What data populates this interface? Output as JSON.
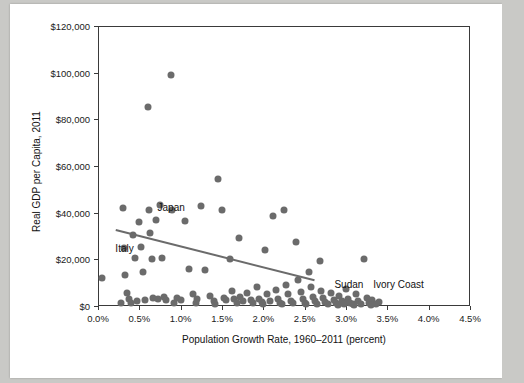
{
  "chart_data": {
    "type": "scatter",
    "title": "",
    "xlabel": "Population Growth Rate, 1960–2011 (percent)",
    "ylabel": "Real GDP per Capita, 2011",
    "xlim": [
      0.0,
      4.5
    ],
    "ylim": [
      0,
      120000
    ],
    "grid": false,
    "legend": "none",
    "xticks": [
      "0.0%",
      "0.5%",
      "1.0%",
      "1.5%",
      "2.0%",
      "2.5%",
      "3.0%",
      "3.5%",
      "4.0%",
      "4.5%"
    ],
    "xtick_values": [
      0.0,
      0.5,
      1.0,
      1.5,
      2.0,
      2.5,
      3.0,
      3.5,
      4.0,
      4.5
    ],
    "yticks": [
      "$0",
      "$20,000",
      "$40,000",
      "$60,000",
      "$80,000",
      "$100,000",
      "$120,000"
    ],
    "ytick_values": [
      0,
      20000,
      40000,
      60000,
      80000,
      100000,
      120000
    ],
    "annotations": [
      {
        "label": "Japan",
        "x": 0.72,
        "y": 41500
      },
      {
        "label": "Italy",
        "x": 0.21,
        "y": 24000
      },
      {
        "label": "Sudan",
        "x": 2.86,
        "y": 8500
      },
      {
        "label": "Ivory Coast",
        "x": 3.33,
        "y": 8500
      }
    ],
    "trendline": {
      "x0": 0.22,
      "y0": 33000,
      "x1": 2.62,
      "y1": 11500
    },
    "points": [
      {
        "x": 0.05,
        "y": 12000
      },
      {
        "x": 0.3,
        "y": 42000
      },
      {
        "x": 0.32,
        "y": 25000
      },
      {
        "x": 0.33,
        "y": 13500
      },
      {
        "x": 0.35,
        "y": 5500
      },
      {
        "x": 0.38,
        "y": 3000
      },
      {
        "x": 0.42,
        "y": 30500
      },
      {
        "x": 0.45,
        "y": 20500
      },
      {
        "x": 0.47,
        "y": 2000
      },
      {
        "x": 0.5,
        "y": 36000
      },
      {
        "x": 0.52,
        "y": 25500
      },
      {
        "x": 0.55,
        "y": 14500
      },
      {
        "x": 0.57,
        "y": 2500
      },
      {
        "x": 0.6,
        "y": 85500
      },
      {
        "x": 0.62,
        "y": 41000
      },
      {
        "x": 0.63,
        "y": 31500
      },
      {
        "x": 0.65,
        "y": 20000
      },
      {
        "x": 0.66,
        "y": 3500
      },
      {
        "x": 0.7,
        "y": 37000
      },
      {
        "x": 0.72,
        "y": 3000
      },
      {
        "x": 0.75,
        "y": 43500
      },
      {
        "x": 0.78,
        "y": 20500
      },
      {
        "x": 0.8,
        "y": 4000
      },
      {
        "x": 0.82,
        "y": 2500
      },
      {
        "x": 0.88,
        "y": 99000
      },
      {
        "x": 0.9,
        "y": 41000
      },
      {
        "x": 0.95,
        "y": 3500
      },
      {
        "x": 1.0,
        "y": 2500
      },
      {
        "x": 1.05,
        "y": 36500
      },
      {
        "x": 1.1,
        "y": 16000
      },
      {
        "x": 1.15,
        "y": 5000
      },
      {
        "x": 1.2,
        "y": 3000
      },
      {
        "x": 1.25,
        "y": 43000
      },
      {
        "x": 1.3,
        "y": 15500
      },
      {
        "x": 1.35,
        "y": 4500
      },
      {
        "x": 1.4,
        "y": 2000
      },
      {
        "x": 1.45,
        "y": 54500
      },
      {
        "x": 1.5,
        "y": 41000
      },
      {
        "x": 1.52,
        "y": 3500
      },
      {
        "x": 1.55,
        "y": 2500
      },
      {
        "x": 1.6,
        "y": 20000
      },
      {
        "x": 1.62,
        "y": 6500
      },
      {
        "x": 1.65,
        "y": 3000
      },
      {
        "x": 1.7,
        "y": 29000
      },
      {
        "x": 1.72,
        "y": 4000
      },
      {
        "x": 1.75,
        "y": 2000
      },
      {
        "x": 1.8,
        "y": 5500
      },
      {
        "x": 1.85,
        "y": 2500
      },
      {
        "x": 1.88,
        "y": 1500
      },
      {
        "x": 1.92,
        "y": 8000
      },
      {
        "x": 1.95,
        "y": 3000
      },
      {
        "x": 1.98,
        "y": 1800
      },
      {
        "x": 2.02,
        "y": 24000
      },
      {
        "x": 2.05,
        "y": 5000
      },
      {
        "x": 2.08,
        "y": 2000
      },
      {
        "x": 2.12,
        "y": 38500
      },
      {
        "x": 2.15,
        "y": 7000
      },
      {
        "x": 2.18,
        "y": 3000
      },
      {
        "x": 2.2,
        "y": 1500
      },
      {
        "x": 2.25,
        "y": 41000
      },
      {
        "x": 2.28,
        "y": 9000
      },
      {
        "x": 2.3,
        "y": 5000
      },
      {
        "x": 2.33,
        "y": 2000
      },
      {
        "x": 2.36,
        "y": 1200
      },
      {
        "x": 2.4,
        "y": 27500
      },
      {
        "x": 2.42,
        "y": 11000
      },
      {
        "x": 2.45,
        "y": 6000
      },
      {
        "x": 2.48,
        "y": 3000
      },
      {
        "x": 2.5,
        "y": 1500
      },
      {
        "x": 2.55,
        "y": 14500
      },
      {
        "x": 2.58,
        "y": 8000
      },
      {
        "x": 2.6,
        "y": 4000
      },
      {
        "x": 2.62,
        "y": 2000
      },
      {
        "x": 2.65,
        "y": 1000
      },
      {
        "x": 2.68,
        "y": 19500
      },
      {
        "x": 2.7,
        "y": 6500
      },
      {
        "x": 2.72,
        "y": 3500
      },
      {
        "x": 2.75,
        "y": 1800
      },
      {
        "x": 2.78,
        "y": 900
      },
      {
        "x": 2.82,
        "y": 5500
      },
      {
        "x": 2.85,
        "y": 2500
      },
      {
        "x": 2.88,
        "y": 1200
      },
      {
        "x": 2.92,
        "y": 4500
      },
      {
        "x": 2.95,
        "y": 2000
      },
      {
        "x": 2.98,
        "y": 1000
      },
      {
        "x": 3.0,
        "y": 7500
      },
      {
        "x": 3.02,
        "y": 3000
      },
      {
        "x": 3.05,
        "y": 1500
      },
      {
        "x": 3.08,
        "y": 800
      },
      {
        "x": 3.12,
        "y": 5000
      },
      {
        "x": 3.15,
        "y": 2200
      },
      {
        "x": 3.18,
        "y": 1000
      },
      {
        "x": 3.22,
        "y": 20000
      },
      {
        "x": 3.25,
        "y": 3500
      },
      {
        "x": 3.28,
        "y": 1500
      },
      {
        "x": 3.32,
        "y": 2500
      },
      {
        "x": 3.36,
        "y": 1000
      },
      {
        "x": 3.4,
        "y": 1800
      },
      {
        "x": 0.28,
        "y": 1500
      },
      {
        "x": 0.4,
        "y": 1200
      },
      {
        "x": 0.92,
        "y": 1500
      },
      {
        "x": 1.18,
        "y": 1200
      },
      {
        "x": 1.42,
        "y": 1000
      },
      {
        "x": 1.68,
        "y": 1200
      },
      {
        "x": 2.0,
        "y": 900
      },
      {
        "x": 2.22,
        "y": 700
      },
      {
        "x": 2.52,
        "y": 700
      },
      {
        "x": 2.9,
        "y": 600
      },
      {
        "x": 3.1,
        "y": 500
      },
      {
        "x": 3.3,
        "y": 600
      }
    ]
  }
}
